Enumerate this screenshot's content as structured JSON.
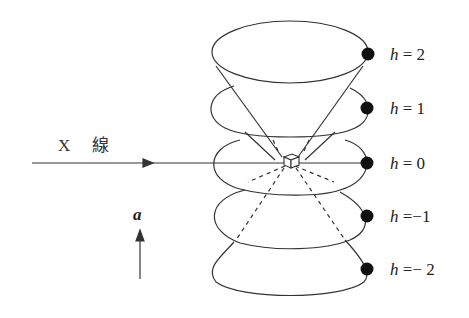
{
  "diagram": {
    "incident_beam": {
      "label_x": "X",
      "label_kanji": "線"
    },
    "axis_label": "a",
    "cones": [
      {
        "h_var": "h",
        "eq": "=",
        "value": "2"
      },
      {
        "h_var": "h",
        "eq": "=",
        "value": "1"
      },
      {
        "h_var": "h",
        "eq": "=",
        "value": "0"
      },
      {
        "h_var": "h",
        "eq": "=",
        "value": "−1"
      },
      {
        "h_var": "h",
        "eq": "=",
        "value": "− 2"
      }
    ],
    "colors": {
      "line": "#333333",
      "dot": "#111111",
      "background": "#ffffff"
    }
  }
}
